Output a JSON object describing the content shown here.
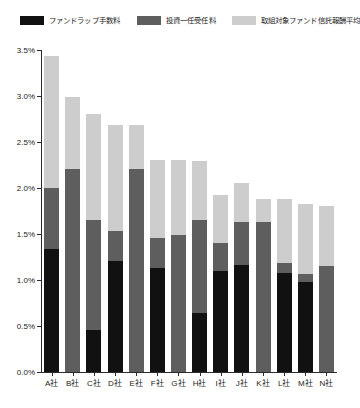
{
  "chart_data": {
    "type": "bar",
    "stacked": true,
    "title": "",
    "xlabel": "",
    "ylabel": "",
    "ylim": [
      0,
      3.5
    ],
    "ytick_labels": [
      "0.0%",
      "0.5%",
      "1.0%",
      "1.5%",
      "2.0%",
      "2.5%",
      "3.0%",
      "3.5%"
    ],
    "ytick_values": [
      0,
      0.5,
      1.0,
      1.5,
      2.0,
      2.5,
      3.0,
      3.5
    ],
    "grid": false,
    "legend_position": "top",
    "categories": [
      "A社",
      "B社",
      "C社",
      "D社",
      "E社",
      "F社",
      "G社",
      "H社",
      "I社",
      "J社",
      "K社",
      "L社",
      "M社",
      "N社"
    ],
    "series": [
      {
        "name": "ファンドラップ手数料",
        "color": "#111111",
        "values": [
          1.34,
          0.0,
          0.46,
          1.21,
          0.0,
          1.13,
          0.0,
          0.64,
          1.1,
          1.16,
          0.0,
          1.08,
          0.98,
          0.0
        ]
      },
      {
        "name": "投資一任受任料",
        "color": "#5e5e5e",
        "values": [
          0.66,
          2.21,
          1.19,
          0.32,
          2.21,
          0.33,
          1.49,
          1.01,
          0.3,
          0.47,
          1.63,
          0.1,
          0.09,
          1.15
        ]
      },
      {
        "name": "取組対象ファンド信託報酬平均",
        "color": "#cdcdcd",
        "values": [
          1.43,
          0.78,
          1.15,
          1.16,
          0.48,
          0.84,
          0.81,
          0.64,
          0.52,
          0.43,
          0.25,
          0.7,
          0.76,
          0.65
        ]
      }
    ],
    "totals": [
      3.43,
      2.99,
      2.8,
      2.69,
      2.69,
      2.3,
      2.3,
      2.29,
      1.92,
      2.06,
      1.88,
      1.88,
      1.83,
      1.8
    ]
  },
  "legend": {
    "items": [
      {
        "label": "ファンドラップ手数料",
        "color": "#111111"
      },
      {
        "label": "投資一任受任料",
        "color": "#5e5e5e"
      },
      {
        "label": "取組対象ファンド信託報酬平均",
        "color": "#cdcdcd"
      }
    ]
  }
}
